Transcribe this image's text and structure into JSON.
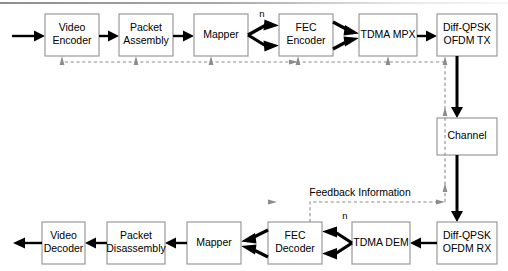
{
  "diagram": {
    "colors": {
      "block_border": "#9a9a9a",
      "block_fill": "#ffffff",
      "signal": "#000000",
      "feedback_dashed": "#8c8c8c",
      "background": "#ffffff"
    },
    "transmit_chain": [
      {
        "id": "video-encoder",
        "line1": "Video",
        "line2": "Encoder"
      },
      {
        "id": "packet-assembly",
        "line1": "Packet",
        "line2": "Assembly"
      },
      {
        "id": "mapper-tx",
        "line1": "Mapper",
        "line2": ""
      },
      {
        "id": "fec-encoder",
        "line1": "FEC",
        "line2": "Encoder"
      },
      {
        "id": "tdma-mpx",
        "line1": "TDMA MPX",
        "line2": ""
      },
      {
        "id": "diff-qpsk-tx",
        "line1": "Diff-QPSK",
        "line2": "OFDM TX"
      }
    ],
    "channel": {
      "id": "channel",
      "line1": "Channel",
      "line2": ""
    },
    "receive_chain": [
      {
        "id": "diff-qpsk-rx",
        "line1": "Diff-QPSK",
        "line2": "OFDM RX"
      },
      {
        "id": "tdma-dem",
        "line1": "TDMA DEM",
        "line2": ""
      },
      {
        "id": "fec-decoder",
        "line1": "FEC",
        "line2": "Decoder"
      },
      {
        "id": "mapper-rx",
        "line1": "Mapper",
        "line2": ""
      },
      {
        "id": "packet-disassembly",
        "line1": "Packet",
        "line2": "Disassembly"
      },
      {
        "id": "video-decoder",
        "line1": "Video",
        "line2": "Decoder"
      }
    ],
    "annotations": {
      "n_branches_tx": "n",
      "n_branches_rx": "n",
      "feedback": "Feedback Information"
    }
  }
}
